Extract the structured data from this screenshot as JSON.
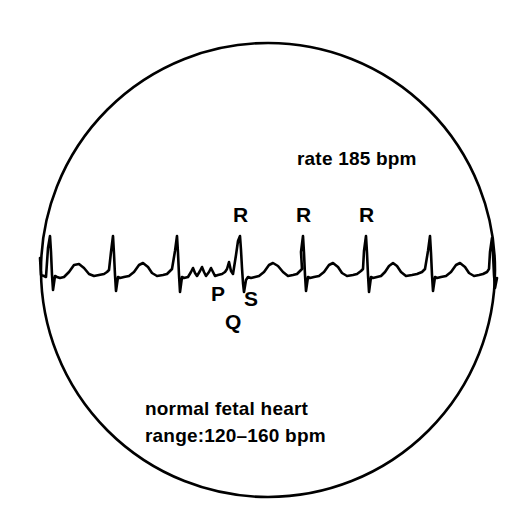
{
  "figure": {
    "kind": "fetal-heart-ecg-tracing",
    "background_color": "#ffffff",
    "ink_color": "#000000"
  },
  "circle": {
    "name": "ultrasound-field-circle",
    "center_x": 268,
    "center_y": 270,
    "radius": 227,
    "stroke_width": 2.6,
    "stroke_color": "#000000",
    "fill": "none"
  },
  "annotations": {
    "rate": "rate 185 bpm",
    "caption_line_1": "normal fetal heart",
    "caption_line_2": "range:120–160 bpm",
    "wave_letters": {
      "r_1": "R",
      "r_2": "R",
      "r_3": "R",
      "p": "P",
      "q": "Q",
      "s": "S"
    }
  },
  "chart_data": {
    "type": "line",
    "title": "",
    "subtitle": "",
    "xlabel": "",
    "ylabel": "",
    "grid": false,
    "legend_position": "none",
    "annotations": [
      {
        "text": "rate 185 bpm",
        "x": 297,
        "y": 160
      },
      {
        "text": "R",
        "x": 240,
        "y": 215
      },
      {
        "text": "R",
        "x": 303,
        "y": 215
      },
      {
        "text": "R",
        "x": 366,
        "y": 215
      },
      {
        "text": "P",
        "x": 218,
        "y": 294
      },
      {
        "text": "S",
        "x": 250,
        "y": 299
      },
      {
        "text": "Q",
        "x": 232,
        "y": 322
      },
      {
        "text": "normal fetal heart",
        "x": 145,
        "y": 409
      },
      {
        "text": "range:120–160 bpm",
        "x": 145,
        "y": 436
      }
    ],
    "trace": {
      "name": "fetal-ecg-waveform",
      "stroke_color": "#000000",
      "stroke_width": 2.6,
      "baseline_y": 275,
      "r_peak_y": 236,
      "s_trough_y": 293,
      "t_peak_y": 264,
      "p_peak_y": 269,
      "beat_spacing_px": 63,
      "r_peak_x_positions": [
        50,
        113,
        177,
        240,
        303,
        366,
        430,
        492
      ],
      "rate_bpm": 185,
      "normal_range_bpm": [
        120,
        160
      ],
      "x_start": 40,
      "x_end": 497,
      "points": [
        [
          40,
          258
        ],
        [
          41,
          275
        ],
        [
          44,
          276
        ],
        [
          46,
          277
        ],
        [
          48,
          248
        ],
        [
          50,
          236
        ],
        [
          51,
          252
        ],
        [
          52,
          275
        ],
        [
          53,
          290
        ],
        [
          55,
          276
        ],
        [
          57,
          277
        ],
        [
          60,
          278
        ],
        [
          64,
          277
        ],
        [
          69,
          272
        ],
        [
          74,
          265
        ],
        [
          79,
          264
        ],
        [
          84,
          268
        ],
        [
          89,
          274
        ],
        [
          94,
          276
        ],
        [
          99,
          275
        ],
        [
          104,
          274
        ],
        [
          107,
          272
        ],
        [
          109,
          270
        ],
        [
          111,
          252
        ],
        [
          113,
          236
        ],
        [
          114,
          254
        ],
        [
          115,
          275
        ],
        [
          116,
          291
        ],
        [
          118,
          277
        ],
        [
          120,
          278
        ],
        [
          124,
          277
        ],
        [
          129,
          276
        ],
        [
          134,
          272
        ],
        [
          139,
          265
        ],
        [
          143,
          263
        ],
        [
          148,
          267
        ],
        [
          152,
          273
        ],
        [
          157,
          276
        ],
        [
          163,
          275
        ],
        [
          167,
          274
        ],
        [
          170,
          271
        ],
        [
          172,
          269
        ],
        [
          175,
          251
        ],
        [
          177,
          236
        ],
        [
          178,
          253
        ],
        [
          179,
          275
        ],
        [
          180,
          292
        ],
        [
          182,
          277
        ],
        [
          184,
          278
        ],
        [
          188,
          277
        ],
        [
          191,
          272
        ],
        [
          193,
          268
        ],
        [
          195,
          273
        ],
        [
          197,
          276
        ],
        [
          200,
          271
        ],
        [
          202,
          267
        ],
        [
          204,
          272
        ],
        [
          206,
          276
        ],
        [
          209,
          272
        ],
        [
          211,
          268
        ],
        [
          213,
          272
        ],
        [
          215,
          276
        ],
        [
          218,
          275
        ],
        [
          222,
          274
        ],
        [
          225,
          272
        ],
        [
          227,
          269
        ],
        [
          229,
          262
        ],
        [
          231,
          271
        ],
        [
          233,
          274
        ],
        [
          236,
          255
        ],
        [
          238,
          241
        ],
        [
          240,
          236
        ],
        [
          241,
          250
        ],
        [
          242,
          268
        ],
        [
          243,
          283
        ],
        [
          244,
          292
        ],
        [
          246,
          280
        ],
        [
          248,
          277
        ],
        [
          251,
          278
        ],
        [
          255,
          277
        ],
        [
          259,
          276
        ],
        [
          264,
          272
        ],
        [
          269,
          265
        ],
        [
          273,
          263
        ],
        [
          278,
          266
        ],
        [
          283,
          272
        ],
        [
          288,
          276
        ],
        [
          293,
          275
        ],
        [
          297,
          274
        ],
        [
          300,
          271
        ],
        [
          302,
          269
        ],
        [
          301,
          252
        ],
        [
          303,
          236
        ],
        [
          304,
          253
        ],
        [
          305,
          275
        ],
        [
          306,
          291
        ],
        [
          308,
          277
        ],
        [
          310,
          278
        ],
        [
          314,
          277
        ],
        [
          319,
          276
        ],
        [
          324,
          272
        ],
        [
          329,
          265
        ],
        [
          333,
          263
        ],
        [
          338,
          267
        ],
        [
          342,
          273
        ],
        [
          347,
          276
        ],
        [
          353,
          275
        ],
        [
          357,
          274
        ],
        [
          361,
          271
        ],
        [
          363,
          269
        ],
        [
          364,
          251
        ],
        [
          366,
          236
        ],
        [
          367,
          253
        ],
        [
          368,
          275
        ],
        [
          369,
          292
        ],
        [
          371,
          277
        ],
        [
          373,
          278
        ],
        [
          377,
          277
        ],
        [
          381,
          276
        ],
        [
          385,
          272
        ],
        [
          389,
          266
        ],
        [
          393,
          263
        ],
        [
          397,
          266
        ],
        [
          401,
          272
        ],
        [
          406,
          276
        ],
        [
          412,
          275
        ],
        [
          417,
          274
        ],
        [
          422,
          272
        ],
        [
          425,
          269
        ],
        [
          428,
          251
        ],
        [
          430,
          236
        ],
        [
          431,
          253
        ],
        [
          432,
          275
        ],
        [
          433,
          291
        ],
        [
          435,
          277
        ],
        [
          437,
          278
        ],
        [
          441,
          277
        ],
        [
          446,
          276
        ],
        [
          451,
          272
        ],
        [
          456,
          265
        ],
        [
          460,
          263
        ],
        [
          465,
          267
        ],
        [
          469,
          273
        ],
        [
          474,
          276
        ],
        [
          479,
          275
        ],
        [
          483,
          274
        ],
        [
          487,
          272
        ],
        [
          489,
          269
        ],
        [
          490,
          252
        ],
        [
          492,
          238
        ],
        [
          493,
          254
        ],
        [
          494,
          275
        ],
        [
          495,
          288
        ],
        [
          497,
          278
        ]
      ]
    }
  }
}
